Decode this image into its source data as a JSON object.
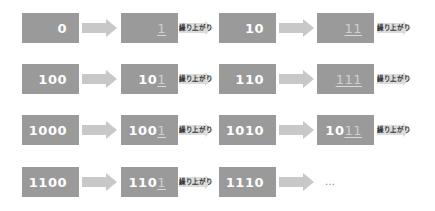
{
  "colors": {
    "box_fill": "#9a9a9a",
    "box_text": "#ffffff",
    "changed_digit": "#cfcfcf",
    "arrow_fill": "#c8c8c8",
    "carry_arrow_fill": "#dcdcdc",
    "carry_text": "#333333"
  },
  "carry_label": "繰り上がり",
  "ellipsis": "…",
  "rows": [
    {
      "left": {
        "value": "0"
      },
      "right": {
        "same": "",
        "changed": "1"
      },
      "right_carry": true,
      "left2": {
        "value": "10"
      },
      "right2": {
        "same": "",
        "changed": "11"
      },
      "right2_carry": true
    },
    {
      "left": {
        "value": "100"
      },
      "right": {
        "same": "10",
        "changed": "1"
      },
      "right_carry": true,
      "left2": {
        "value": "110"
      },
      "right2": {
        "same": "",
        "changed": "111"
      },
      "right2_carry": true
    },
    {
      "left": {
        "value": "1000"
      },
      "right": {
        "same": "100",
        "changed": "1"
      },
      "right_carry": true,
      "left2": {
        "value": "1010"
      },
      "right2": {
        "same": "10",
        "changed": "11"
      },
      "right2_carry": true
    },
    {
      "left": {
        "value": "1100"
      },
      "right": {
        "same": "110",
        "changed": "1"
      },
      "right_carry": true,
      "left2": {
        "value": "1110"
      },
      "right2": null,
      "right2_carry": false
    }
  ]
}
